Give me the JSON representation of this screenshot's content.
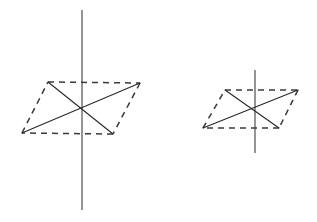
{
  "figure": {
    "background_color": "#ffffff",
    "width": 317,
    "height": 222,
    "stroke_colors": {
      "solid": "#2a2a2a",
      "dashed": "#3a3a3a",
      "axis": "#555555"
    },
    "dash_pattern": "6 5"
  },
  "chart_data": {
    "type": "scatter",
    "xlabel": "",
    "ylabel": "",
    "xlim": [
      0,
      317
    ],
    "ylim": [
      222,
      0
    ],
    "grid": false,
    "legend": "none",
    "shapes": [
      {
        "name": "left-parallelogram",
        "style": "dashed",
        "vertices": [
          {
            "label": "top-left",
            "x": 48,
            "y": 82
          },
          {
            "label": "top-right",
            "x": 140,
            "y": 83
          },
          {
            "label": "bottom-right",
            "x": 113,
            "y": 134
          },
          {
            "label": "bottom-left",
            "x": 22,
            "y": 133
          }
        ],
        "diagonals": [
          {
            "style": "solid",
            "from": "top-left",
            "to": "bottom-right"
          },
          {
            "style": "solid",
            "from": "bottom-left",
            "to": "top-right"
          }
        ],
        "axis": {
          "name": "left-vertical-axis",
          "style": "solid",
          "x": 82,
          "y_top": 10,
          "y_bottom": 210
        },
        "center": {
          "x": 82,
          "y": 108
        }
      },
      {
        "name": "right-parallelogram",
        "style": "dashed",
        "vertices": [
          {
            "label": "top-left",
            "x": 225,
            "y": 90
          },
          {
            "label": "top-right",
            "x": 298,
            "y": 90
          },
          {
            "label": "bottom-right",
            "x": 279,
            "y": 128
          },
          {
            "label": "bottom-left",
            "x": 203,
            "y": 128
          }
        ],
        "diagonals": [
          {
            "style": "solid",
            "from": "top-left",
            "to": "bottom-right"
          },
          {
            "style": "solid",
            "from": "bottom-left",
            "to": "top-right"
          }
        ],
        "axis": {
          "name": "right-vertical-axis",
          "style": "solid",
          "x": 255,
          "y_top": 70,
          "y_bottom": 153
        },
        "center": {
          "x": 255,
          "y": 109
        }
      }
    ]
  }
}
